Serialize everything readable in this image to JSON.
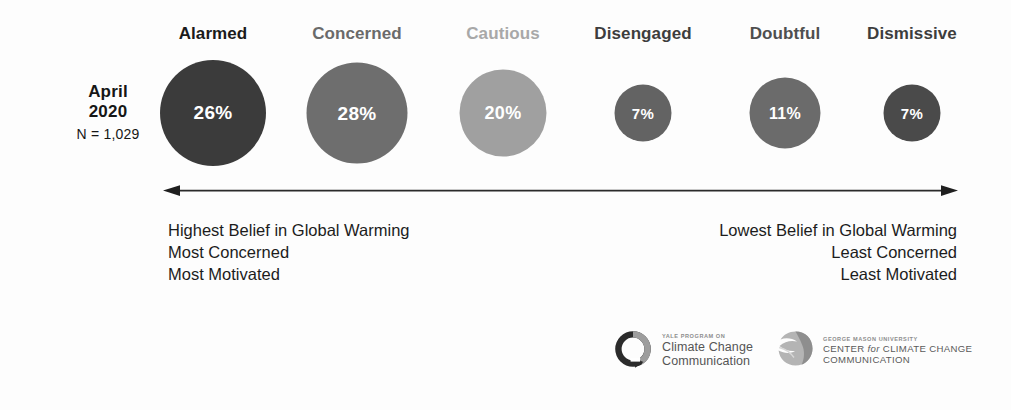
{
  "survey": {
    "month": "April",
    "year": "2020",
    "sample": "N = 1,029"
  },
  "chart_data": {
    "type": "bar",
    "categories": [
      "Alarmed",
      "Concerned",
      "Cautious",
      "Disengaged",
      "Doubtful",
      "Dismissive"
    ],
    "values": [
      26,
      28,
      20,
      7,
      11,
      7
    ],
    "value_labels": [
      "26%",
      "28%",
      "20%",
      "7%",
      "11%",
      "7%"
    ],
    "xlabel": "",
    "ylabel": "Percent of U.S. adults",
    "ylim": [
      0,
      30
    ],
    "grid": false,
    "legend": "none",
    "encoding": "proportional circle area",
    "segment_colors": [
      "#3b3b3b",
      "#6e6e6e",
      "#a0a0a0",
      "#636363",
      "#6b6b6b",
      "#4a4a4a"
    ],
    "label_colors": [
      "#1b1b1b",
      "#6a6a6a",
      "#a8a8a8",
      "#3d3d3d",
      "#4f4f4f",
      "#3d3d3d"
    ],
    "bubble_diameters_px": [
      106,
      101,
      87,
      57,
      71,
      57
    ],
    "bubble_centers_x_px": [
      213,
      357,
      503,
      643,
      785,
      912
    ],
    "bubble_center_y_px": 113,
    "value_font_sizes_px": [
      19,
      19,
      18,
      15,
      16,
      15
    ]
  },
  "axis": {
    "left_arrow": "left-arrowhead",
    "right_arrow": "right-arrowhead",
    "color": "#2a2a2a"
  },
  "descriptions": {
    "left": "Highest Belief in Global Warming\nMost Concerned\nMost Motivated",
    "right": "Lowest Belief in Global Warming\nLeast Concerned\nLeast Motivated"
  },
  "logos": {
    "yale": {
      "kicker": "YALE PROGRAM ON",
      "line1": "Climate Change",
      "line2": "Communication",
      "mark": "circular-arrow-ring-icon"
    },
    "gmu": {
      "kicker": "GEORGE MASON UNIVERSITY",
      "line1_a": "CENTER ",
      "line1_it": "for",
      "line1_b": " CLIMATE CHANGE",
      "line2": "COMMUNICATION",
      "mark": "gmu-mason-plume-icon"
    }
  }
}
